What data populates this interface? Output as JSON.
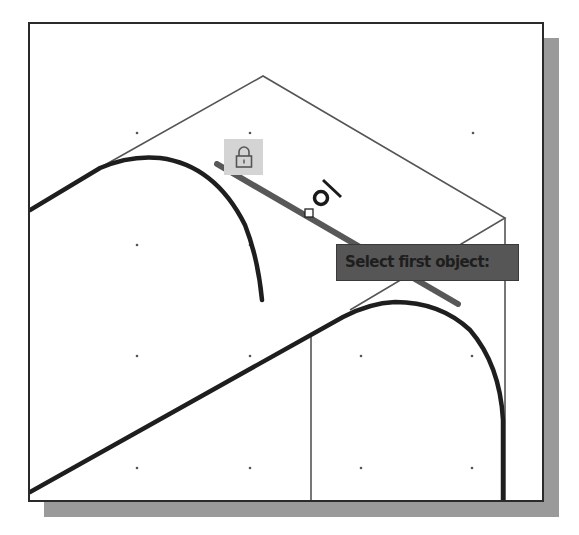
{
  "viewport": {
    "name": "drawing-area",
    "background": "#ffffff",
    "border_color": "#2a2a2a",
    "shadow_color": "#9a9a9a"
  },
  "grid": {
    "dot_color": "#555555",
    "columns_x": [
      137,
      250,
      361,
      473
    ],
    "rows_y": [
      133,
      245,
      356,
      468
    ]
  },
  "cursor": {
    "snap_marker": "tangent-snap-icon",
    "midpoint_marker": "midpoint-square-icon"
  },
  "lock_badge": {
    "icon": "lock-icon",
    "background": "#d4d4d4"
  },
  "tooltip": {
    "text": "Select first object:",
    "background": "#565656",
    "text_color": "#1e1e1e"
  },
  "highlighted_object": {
    "type": "line",
    "color": "#3c3c3c"
  }
}
